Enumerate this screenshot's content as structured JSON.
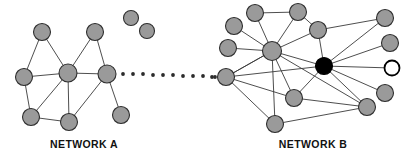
{
  "figure": {
    "title_a": "NETWORK A",
    "title_b": "NETWORK B",
    "background_color": "#ffffff",
    "node_fill_color": "#9a9a9a",
    "node_stroke_color": "#2e2e2e",
    "edge_color": "#3a3a3a",
    "highlight_node_color": "#000000",
    "hollow_node_color": "#ffffff",
    "label_color": "#111111"
  },
  "chart_data": {
    "type": "diagram",
    "subtype": "node-link-network",
    "title": "",
    "legend": [],
    "annotations": [
      "NETWORK A",
      "NETWORK B"
    ],
    "networks": [
      {
        "id": "A",
        "label": "NETWORK A",
        "label_x": 84,
        "label_y": 148,
        "node_count": 8,
        "edge_count": 12,
        "nodes": [
          {
            "id": "a1",
            "x": 42,
            "y": 32,
            "r": 8.5,
            "style": "gray"
          },
          {
            "id": "a2",
            "x": 95,
            "y": 32,
            "r": 8.5,
            "style": "gray"
          },
          {
            "id": "a3",
            "x": 24,
            "y": 77,
            "r": 8.5,
            "style": "gray"
          },
          {
            "id": "a4",
            "x": 68,
            "y": 73,
            "r": 9.0,
            "style": "gray"
          },
          {
            "id": "a5",
            "x": 107,
            "y": 74,
            "r": 9.0,
            "style": "gray"
          },
          {
            "id": "a6",
            "x": 31,
            "y": 117,
            "r": 8.5,
            "style": "gray"
          },
          {
            "id": "a7",
            "x": 69,
            "y": 122,
            "r": 8.5,
            "style": "gray"
          },
          {
            "id": "a8",
            "x": 121,
            "y": 115,
            "r": 8.5,
            "style": "gray"
          }
        ],
        "edges": [
          [
            "a1",
            "a3"
          ],
          [
            "a1",
            "a4"
          ],
          [
            "a2",
            "a4"
          ],
          [
            "a2",
            "a5"
          ],
          [
            "a3",
            "a6"
          ],
          [
            "a4",
            "a5"
          ],
          [
            "a4",
            "a6"
          ],
          [
            "a4",
            "a7"
          ],
          [
            "a5",
            "a7"
          ],
          [
            "a5",
            "a8"
          ],
          [
            "a6",
            "a7"
          ],
          [
            "a4",
            "a3"
          ]
        ]
      },
      {
        "id": "B",
        "label": "NETWORK B",
        "label_x": 313,
        "label_y": 148,
        "node_count": 14,
        "edge_count": 26,
        "nodes": [
          {
            "id": "b1",
            "x": 255,
            "y": 13,
            "r": 8.5,
            "style": "gray"
          },
          {
            "id": "b2",
            "x": 298,
            "y": 12,
            "r": 8.5,
            "style": "gray"
          },
          {
            "id": "b3",
            "x": 234,
            "y": 26,
            "r": 8.5,
            "style": "gray"
          },
          {
            "id": "b4",
            "x": 228,
            "y": 48,
            "r": 8.5,
            "style": "gray"
          },
          {
            "id": "b5",
            "x": 272,
            "y": 51,
            "r": 9.5,
            "style": "gray"
          },
          {
            "id": "b6",
            "x": 318,
            "y": 30,
            "r": 8.5,
            "style": "gray"
          },
          {
            "id": "b7",
            "x": 385,
            "y": 18,
            "r": 8.5,
            "style": "gray"
          },
          {
            "id": "b8",
            "x": 390,
            "y": 43,
            "r": 8.5,
            "style": "gray"
          },
          {
            "id": "b9",
            "x": 324,
            "y": 66,
            "r": 8.5,
            "style": "black"
          },
          {
            "id": "b10",
            "x": 392,
            "y": 68,
            "r": 7.5,
            "style": "hollow"
          },
          {
            "id": "b11",
            "x": 226,
            "y": 77,
            "r": 8.5,
            "style": "gray"
          },
          {
            "id": "b12",
            "x": 385,
            "y": 93,
            "r": 8.5,
            "style": "gray"
          },
          {
            "id": "b13",
            "x": 294,
            "y": 98,
            "r": 8.5,
            "style": "gray"
          },
          {
            "id": "b14",
            "x": 367,
            "y": 107,
            "r": 8.5,
            "style": "gray"
          },
          {
            "id": "b15",
            "x": 275,
            "y": 124,
            "r": 8.5,
            "style": "gray"
          }
        ],
        "edges": [
          [
            "b1",
            "b2"
          ],
          [
            "b1",
            "b5"
          ],
          [
            "b2",
            "b5"
          ],
          [
            "b3",
            "b5"
          ],
          [
            "b4",
            "b5"
          ],
          [
            "b5",
            "b6"
          ],
          [
            "b5",
            "b9"
          ],
          [
            "b5",
            "b11"
          ],
          [
            "b5",
            "b13"
          ],
          [
            "b5",
            "b15"
          ],
          [
            "b5",
            "b14"
          ],
          [
            "b6",
            "b7"
          ],
          [
            "b6",
            "b9"
          ],
          [
            "b6",
            "b2"
          ],
          [
            "b9",
            "b7"
          ],
          [
            "b9",
            "b8"
          ],
          [
            "b9",
            "b10"
          ],
          [
            "b9",
            "b12"
          ],
          [
            "b9",
            "b14"
          ],
          [
            "b9",
            "b13"
          ],
          [
            "b9",
            "b11"
          ],
          [
            "b11",
            "b13"
          ],
          [
            "b11",
            "b15"
          ],
          [
            "b13",
            "b14"
          ],
          [
            "b14",
            "b15"
          ],
          [
            "b11",
            "b5"
          ]
        ]
      }
    ],
    "isolated_nodes": [
      {
        "id": "iso1",
        "x": 131,
        "y": 18,
        "r": 7.5,
        "style": "gray"
      },
      {
        "id": "iso2",
        "x": 147,
        "y": 31,
        "r": 7.5,
        "style": "gray"
      }
    ],
    "bridge": {
      "description": "dotted connector between NETWORK A and NETWORK B",
      "from_node": "a5",
      "to_node": "b11",
      "style": "dotted",
      "dot_radius": 1.9,
      "dots": [
        {
          "x": 123,
          "y": 74
        },
        {
          "x": 133,
          "y": 74
        },
        {
          "x": 143,
          "y": 74
        },
        {
          "x": 153,
          "y": 75
        },
        {
          "x": 163,
          "y": 75
        },
        {
          "x": 173,
          "y": 75
        },
        {
          "x": 183,
          "y": 76
        },
        {
          "x": 193,
          "y": 76
        },
        {
          "x": 203,
          "y": 76
        },
        {
          "x": 212,
          "y": 77
        },
        {
          "x": 215,
          "y": 77
        }
      ]
    }
  }
}
